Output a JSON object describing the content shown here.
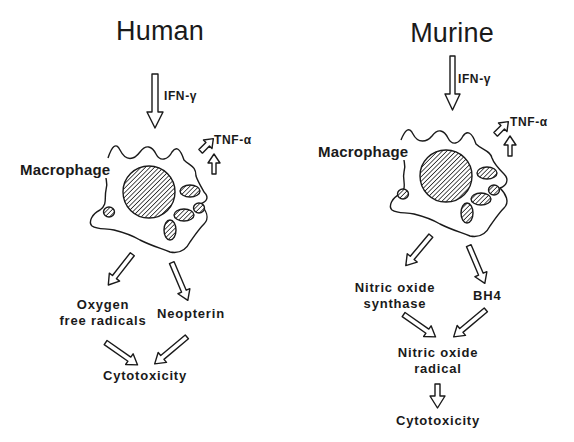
{
  "figure": {
    "type": "pathway-diagram",
    "colors": {
      "ink": "#1a1a1a",
      "background": "#ffffff"
    },
    "panels": [
      {
        "id": "human",
        "title": "Human",
        "stimulus": "IFN-γ",
        "cytokine": "TNF-α",
        "cell_label": "Macrophage",
        "products": [
          "Oxygen free radicals",
          "Neopterin"
        ],
        "products_display": {
          "left_line1": "Oxygen",
          "left_line2": "free radicals",
          "right": "Neopterin"
        },
        "outcome": "Cytotoxicity",
        "edges": [
          [
            "IFN-γ",
            "Macrophage"
          ],
          [
            "Macrophage",
            "TNF-α"
          ],
          [
            "TNF-α",
            "Macrophage"
          ],
          [
            "Macrophage",
            "Oxygen free radicals"
          ],
          [
            "Macrophage",
            "Neopterin"
          ],
          [
            "Oxygen free radicals",
            "Cytotoxicity"
          ],
          [
            "Neopterin",
            "Cytotoxicity"
          ]
        ]
      },
      {
        "id": "murine",
        "title": "Murine",
        "stimulus": "IFN-γ",
        "cytokine": "TNF-α",
        "cell_label": "Macrophage",
        "products": [
          "Nitric oxide synthase",
          "BH4"
        ],
        "products_display": {
          "left_line1": "Nitric oxide",
          "left_line2": "synthase",
          "right": "BH4"
        },
        "intermediate": "Nitric oxide radical",
        "intermediate_display": {
          "line1": "Nitric oxide",
          "line2": "radical"
        },
        "outcome": "Cytotoxicity",
        "edges": [
          [
            "IFN-γ",
            "Macrophage"
          ],
          [
            "Macrophage",
            "TNF-α"
          ],
          [
            "TNF-α",
            "Macrophage"
          ],
          [
            "Macrophage",
            "Nitric oxide synthase"
          ],
          [
            "Macrophage",
            "BH4"
          ],
          [
            "Nitric oxide synthase",
            "Nitric oxide radical"
          ],
          [
            "BH4",
            "Nitric oxide radical"
          ],
          [
            "Nitric oxide radical",
            "Cytotoxicity"
          ]
        ]
      }
    ]
  }
}
